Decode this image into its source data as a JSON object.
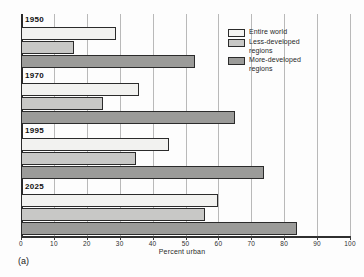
{
  "figure": {
    "caption": "(a)"
  },
  "chart_data": {
    "type": "bar",
    "orientation": "horizontal",
    "title": "",
    "xlabel": "Percent urban",
    "ylabel": "",
    "xlim": [
      0,
      100
    ],
    "xticks": [
      0,
      10,
      20,
      30,
      40,
      50,
      60,
      70,
      80,
      90,
      100
    ],
    "xtick_labels": [
      "0",
      "10",
      "20",
      "30",
      "40",
      "50",
      "60",
      "70",
      "80",
      "90",
      "100"
    ],
    "grid": "vertical",
    "legend_position": "upper right",
    "categories": [
      "1950",
      "1970",
      "1995",
      "2025"
    ],
    "series": [
      {
        "name": "Entire world",
        "color": "#f2f2f0",
        "values": [
          29,
          36,
          45,
          60
        ]
      },
      {
        "name": "Less-developed regions",
        "color": "#c8c8c6",
        "values": [
          16,
          25,
          35,
          56
        ]
      },
      {
        "name": "More-developed regions",
        "color": "#9b9b99",
        "values": [
          53,
          65,
          74,
          84
        ]
      }
    ]
  },
  "legend": {
    "items": [
      {
        "label": "Entire world",
        "swatch": "entire-world-swatch"
      },
      {
        "label": "Less-developed\nregions",
        "swatch": "less-developed-swatch"
      },
      {
        "label": "More-developed\nregions",
        "swatch": "more-developed-swatch"
      }
    ]
  }
}
